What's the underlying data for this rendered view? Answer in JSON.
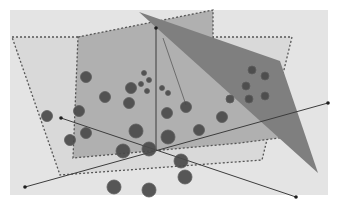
{
  "diagram": {
    "title": "",
    "canvas": {
      "width": 338,
      "height": 209,
      "background": "#ffffff"
    },
    "panel": {
      "x": 10,
      "y": 10,
      "width": 318,
      "height": 185,
      "fill": "#e4e4e4"
    },
    "planes": [
      {
        "name": "outer-dashed-plane",
        "points": "12,37 292,37 262,160 60,175",
        "fill": "#d9d9d9",
        "stroke": "#555555",
        "dashed": true
      },
      {
        "name": "middle-dashed-plane",
        "points": "78,37 213,10 213,75 302,135 240,143 73,158",
        "fill": "#b0b0b0",
        "stroke": "#555555",
        "dashed": true
      },
      {
        "name": "dark-tilted-plane",
        "points": "139,12 280,61 318,173",
        "fill": "#7f7f7f",
        "stroke": "none",
        "dashed": false
      }
    ],
    "axes": [
      {
        "name": "vertical-axis",
        "x1": 156,
        "y1": 28,
        "x2": 156,
        "y2": 150,
        "endpoint": "top"
      },
      {
        "name": "diagonal-axis-up",
        "x1": 25,
        "y1": 187,
        "x2": 328,
        "y2": 103,
        "endpoint": "both"
      },
      {
        "name": "diagonal-axis-down",
        "x1": 61,
        "y1": 118,
        "x2": 296,
        "y2": 197,
        "endpoint": "both"
      }
    ],
    "thin_line": {
      "x1": 163,
      "y1": 38,
      "x2": 186,
      "y2": 105
    },
    "points": [
      {
        "cx": 86,
        "cy": 77,
        "r": 5.5
      },
      {
        "cx": 105,
        "cy": 97,
        "r": 5.5
      },
      {
        "cx": 131,
        "cy": 88,
        "r": 5.5
      },
      {
        "cx": 129,
        "cy": 103,
        "r": 5.5
      },
      {
        "cx": 79,
        "cy": 111,
        "r": 5.5
      },
      {
        "cx": 86,
        "cy": 133,
        "r": 5.5
      },
      {
        "cx": 47,
        "cy": 116,
        "r": 5.5
      },
      {
        "cx": 70,
        "cy": 140,
        "r": 5.5
      },
      {
        "cx": 144,
        "cy": 73,
        "r": 2.5
      },
      {
        "cx": 149,
        "cy": 80,
        "r": 2.5
      },
      {
        "cx": 141,
        "cy": 84,
        "r": 2.5
      },
      {
        "cx": 147,
        "cy": 91,
        "r": 2.5
      },
      {
        "cx": 162,
        "cy": 88,
        "r": 2.5
      },
      {
        "cx": 168,
        "cy": 93,
        "r": 2.5
      },
      {
        "cx": 186,
        "cy": 107,
        "r": 5.5
      },
      {
        "cx": 167,
        "cy": 113,
        "r": 5.5
      },
      {
        "cx": 252,
        "cy": 70,
        "r": 4
      },
      {
        "cx": 265,
        "cy": 76,
        "r": 4
      },
      {
        "cx": 246,
        "cy": 86,
        "r": 4
      },
      {
        "cx": 230,
        "cy": 99,
        "r": 4
      },
      {
        "cx": 249,
        "cy": 99,
        "r": 4
      },
      {
        "cx": 265,
        "cy": 96,
        "r": 4
      },
      {
        "cx": 222,
        "cy": 117,
        "r": 5.5
      },
      {
        "cx": 199,
        "cy": 130,
        "r": 5.5
      },
      {
        "cx": 136,
        "cy": 131,
        "r": 7
      },
      {
        "cx": 168,
        "cy": 137,
        "r": 7
      },
      {
        "cx": 123,
        "cy": 151,
        "r": 7
      },
      {
        "cx": 149,
        "cy": 149,
        "r": 7
      },
      {
        "cx": 181,
        "cy": 161,
        "r": 7
      },
      {
        "cx": 185,
        "cy": 177,
        "r": 7
      },
      {
        "cx": 114,
        "cy": 187,
        "r": 7
      },
      {
        "cx": 149,
        "cy": 190,
        "r": 7
      }
    ],
    "colors": {
      "dot_fill": "#4a4a4a",
      "dot_stroke": "#5e5e5e",
      "axis": "#3c3c3c",
      "dash": "#4d4d4d"
    }
  }
}
